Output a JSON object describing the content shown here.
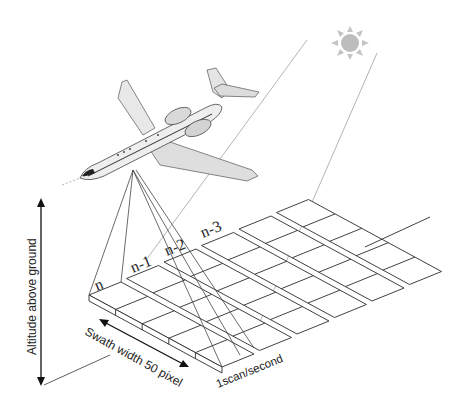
{
  "diagram": {
    "labels": {
      "altitude": "Altitude above ground",
      "swath": "Swath width 50 pixel",
      "scan_rate": "1scan/second",
      "strip_n": "n",
      "strip_n1": "n-1",
      "strip_n2": "n-2",
      "strip_n3": "n-3"
    },
    "icons": {
      "sun": "sun-icon",
      "aircraft": "aircraft-icon"
    },
    "grid": {
      "strips": 6,
      "cells_across_swath": 5,
      "origin": [
        89,
        295
      ],
      "across_step": [
        26.6,
        14.4
      ],
      "along_width": [
        32,
        -13
      ],
      "strip_step": [
        37.5,
        -16.5
      ]
    },
    "colors": {
      "line": "#2b2b2b",
      "sun": "#bdbdbd",
      "sunray": "#b5b5b5",
      "aircraft_body": "#e6e6e6"
    }
  }
}
